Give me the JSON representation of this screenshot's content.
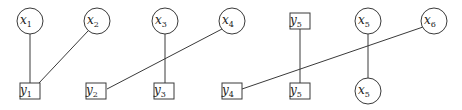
{
  "diagram": {
    "stroke_color": "#3a3a3a",
    "background": "#ffffff",
    "nodes": [
      {
        "id": "x1",
        "shape": "circle",
        "base": "x",
        "sub": "1",
        "cx": 30,
        "cy": 21
      },
      {
        "id": "x2",
        "shape": "circle",
        "base": "x",
        "sub": "2",
        "cx": 97,
        "cy": 21
      },
      {
        "id": "x3",
        "shape": "circle",
        "base": "x",
        "sub": "3",
        "cx": 165,
        "cy": 21
      },
      {
        "id": "x4",
        "shape": "circle",
        "base": "x",
        "sub": "4",
        "cx": 232,
        "cy": 21
      },
      {
        "id": "y5t",
        "shape": "box",
        "base": "y",
        "sub": "5",
        "cx": 300,
        "cy": 21
      },
      {
        "id": "x5t",
        "shape": "circle",
        "base": "x",
        "sub": "5",
        "cx": 368,
        "cy": 21
      },
      {
        "id": "x6",
        "shape": "circle",
        "base": "x",
        "sub": "6",
        "cx": 434,
        "cy": 21
      },
      {
        "id": "y1",
        "shape": "box",
        "base": "y",
        "sub": "1",
        "cx": 30,
        "cy": 91
      },
      {
        "id": "y2",
        "shape": "box",
        "base": "y",
        "sub": "2",
        "cx": 96,
        "cy": 91
      },
      {
        "id": "y3",
        "shape": "box",
        "base": "y",
        "sub": "3",
        "cx": 164,
        "cy": 91
      },
      {
        "id": "y4",
        "shape": "box",
        "base": "y",
        "sub": "4",
        "cx": 232,
        "cy": 91
      },
      {
        "id": "y5b",
        "shape": "box",
        "base": "y",
        "sub": "5",
        "cx": 300,
        "cy": 91
      },
      {
        "id": "x5b",
        "shape": "circle",
        "base": "x",
        "sub": "5",
        "cx": 368,
        "cy": 91
      }
    ],
    "edges": [
      {
        "from": "x1",
        "to": "y1",
        "x1": 30,
        "y1": 34,
        "x2": 30,
        "y2": 83
      },
      {
        "from": "x2",
        "to": "y1",
        "x1": 88,
        "y1": 31,
        "x2": 39,
        "y2": 83
      },
      {
        "from": "x3",
        "to": "y3",
        "x1": 165,
        "y1": 34,
        "x2": 165,
        "y2": 83
      },
      {
        "from": "x4",
        "to": "y2",
        "x1": 222,
        "y1": 29,
        "x2": 107,
        "y2": 89
      },
      {
        "from": "y5t",
        "to": "y5b",
        "x1": 300,
        "y1": 29,
        "x2": 300,
        "y2": 83
      },
      {
        "from": "x5t",
        "to": "x5b",
        "x1": 368,
        "y1": 34,
        "x2": 368,
        "y2": 78
      },
      {
        "from": "x6",
        "to": "y4",
        "x1": 423,
        "y1": 27,
        "x2": 242,
        "y2": 89
      }
    ]
  }
}
